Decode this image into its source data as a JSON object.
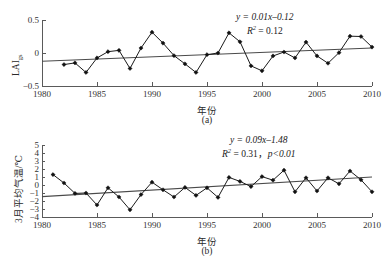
{
  "figure": {
    "width": 392,
    "height": 255,
    "background": "#ffffff",
    "line_color": "#1a1a1a",
    "trend_color": "#4a4a4a",
    "axis_color": "#5a5a5a"
  },
  "chart_data": [
    {
      "type": "line",
      "panel": "a",
      "caption": "(a)",
      "title": "",
      "xlabel": "年份",
      "ylabel": "LAIgs",
      "ylabel_base": "LAI",
      "ylabel_sub": "gs",
      "xlim": [
        1980,
        2010
      ],
      "ylim": [
        -0.5,
        0.5
      ],
      "xticks": [
        1980,
        1985,
        1990,
        1995,
        2000,
        2005,
        2010
      ],
      "xticklabels": [
        "1980",
        "1985",
        "1990",
        "1995",
        "2000",
        "2005",
        "2010"
      ],
      "yticks": [
        -0.5,
        0,
        0.5
      ],
      "yticklabels": [
        "-0.5",
        "0",
        "0.5"
      ],
      "grid": false,
      "legend": "none",
      "annotations": [
        "y = 0.01x–0.12",
        "R² = 0.12"
      ],
      "equation": "y = 0.01x–0.12",
      "r_squared_label": "R",
      "r_squared_value": " = 0.12",
      "trend_slope": 0.01,
      "trend_intercept": -0.12,
      "trend_endpoints": [
        {
          "x": 1980,
          "y": -0.125
        },
        {
          "x": 2010,
          "y": 0.075
        }
      ],
      "x": [
        1982,
        1983,
        1984,
        1985,
        1986,
        1987,
        1988,
        1989,
        1990,
        1991,
        1992,
        1993,
        1994,
        1995,
        1996,
        1997,
        1998,
        1999,
        2000,
        2001,
        2002,
        2003,
        2004,
        2005,
        2006,
        2007,
        2008,
        2009,
        2010
      ],
      "values": [
        -0.175,
        -0.15,
        -0.295,
        -0.075,
        0.02,
        0.04,
        -0.235,
        0.075,
        0.315,
        0.15,
        -0.04,
        -0.165,
        -0.295,
        -0.025,
        0.0,
        0.305,
        0.17,
        -0.195,
        -0.27,
        -0.045,
        0.015,
        -0.075,
        0.165,
        -0.045,
        -0.155,
        0.005,
        0.255,
        0.25,
        0.09
      ]
    },
    {
      "type": "line",
      "panel": "b",
      "caption": "(b)",
      "title": "",
      "xlabel": "年份",
      "ylabel": "3月平均气温/℃",
      "xlim": [
        1980,
        2010
      ],
      "ylim": [
        -4,
        5
      ],
      "xticks": [
        1980,
        1985,
        1990,
        1995,
        2000,
        2005,
        2010
      ],
      "xticklabels": [
        "1980",
        "1985",
        "1990",
        "1995",
        "2000",
        "2005",
        "2010"
      ],
      "yticks": [
        -4,
        -3,
        -2,
        -1,
        0,
        1,
        2,
        3,
        4,
        5
      ],
      "yticklabels": [
        "-4",
        "-3",
        "-2",
        "-1",
        "0",
        "1",
        "2",
        "3",
        "4",
        "5"
      ],
      "grid": false,
      "legend": "none",
      "annotations": [
        "y = 0.09x–1.48",
        "R² = 0.31，p<0.01"
      ],
      "equation": "y = 0.09x–1.48",
      "r_squared_label": "R",
      "r_squared_value": " = 0.31，",
      "p_value": "p<0.01",
      "trend_slope": 0.09,
      "trend_intercept": -1.48,
      "trend_endpoints": [
        {
          "x": 1980,
          "y": -1.45
        },
        {
          "x": 2010,
          "y": 1.0
        }
      ],
      "x": [
        1981,
        1982,
        1983,
        1984,
        1985,
        1986,
        1987,
        1988,
        1989,
        1990,
        1991,
        1992,
        1993,
        1994,
        1995,
        1996,
        1997,
        1998,
        1999,
        2000,
        2001,
        2002,
        2003,
        2004,
        2005,
        2006,
        2007,
        2008,
        2009,
        2010
      ],
      "values": [
        1.3,
        0.25,
        -1.05,
        -1.0,
        -2.5,
        -0.35,
        -1.5,
        -3.1,
        -1.2,
        0.35,
        -0.6,
        -1.5,
        -0.3,
        -1.3,
        -0.35,
        -1.55,
        0.95,
        0.45,
        -0.2,
        1.05,
        0.6,
        1.85,
        -0.85,
        0.9,
        -0.75,
        0.9,
        0.15,
        1.75,
        0.65,
        -0.85
      ]
    }
  ]
}
